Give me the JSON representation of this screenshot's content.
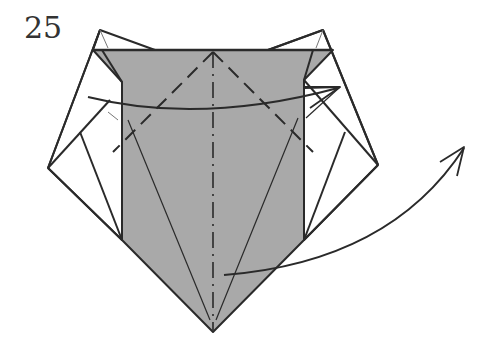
{
  "diagram": {
    "step_number": "25",
    "colors": {
      "paper_gray": "#a9a9a9",
      "line": "#2a2a2a",
      "background": "#ffffff"
    },
    "annotations": [
      {
        "type": "mountain-fold-line",
        "description": "vertical dash-dot center line"
      },
      {
        "type": "valley-fold-lines",
        "description": "dashed diagonal lines from top center"
      },
      {
        "type": "arrow",
        "description": "curved arrow across top (fold)"
      },
      {
        "type": "arrow",
        "description": "curved arrow from bottom center to upper right (turn over / unfold)"
      }
    ]
  }
}
